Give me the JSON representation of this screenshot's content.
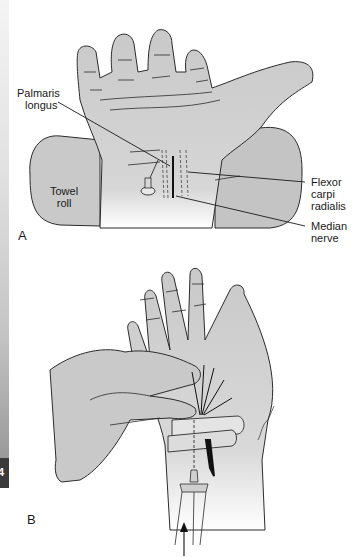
{
  "figure": {
    "edge_tab": {
      "text": "4"
    },
    "panel_a": {
      "letter": "A",
      "labels": {
        "palmaris_longus": "Palmaris\nlongus",
        "palmaris_line1": "Palmaris",
        "palmaris_line2": "longus",
        "towel_line1": "Towel",
        "towel_line2": "roll",
        "flexor_line1": "Flexor",
        "flexor_line2": "carpi",
        "flexor_line3": "radialis",
        "median_line1": "Median",
        "median_line2": "nerve"
      }
    },
    "panel_b": {
      "letter": "B"
    },
    "colors": {
      "skin": "#c9c9c9",
      "outline": "#2b2b2b",
      "background": "#ffffff",
      "nerve_dark": "#111111"
    }
  }
}
